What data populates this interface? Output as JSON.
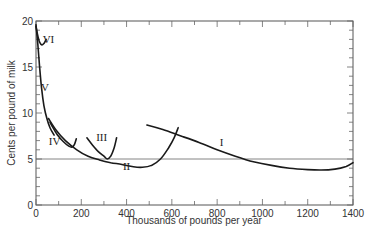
{
  "chart_data": {
    "type": "line",
    "title": "",
    "xlabel": "Thousands of pounds per year",
    "ylabel": "Cents per pound of milk",
    "xlim": [
      0,
      1400
    ],
    "ylim": [
      0,
      20
    ],
    "x_ticks": [
      0,
      200,
      400,
      600,
      800,
      1000,
      1200,
      1400
    ],
    "x_tick_labels": [
      "0",
      "200",
      "400",
      "600",
      "800",
      "1000",
      "1200",
      "1400"
    ],
    "x_minor_step": 100,
    "y_ticks": [
      0,
      5,
      10,
      15,
      20
    ],
    "y_tick_labels": [
      "0",
      "5",
      "10",
      "15",
      "20"
    ],
    "y_minor_step": 1,
    "grid": false,
    "reference_line": {
      "y": 5,
      "label": ""
    },
    "series": [
      {
        "name": "VI",
        "label_pos": [
          55,
          17.6
        ],
        "points": [
          [
            0,
            19.4
          ],
          [
            8,
            18.4
          ],
          [
            16,
            17.7
          ],
          [
            26,
            17.4
          ],
          [
            36,
            17.6
          ],
          [
            45,
            18.0
          ]
        ]
      },
      {
        "name": "V",
        "label_pos": [
          40,
          12.4
        ],
        "points": [
          [
            0,
            19.6
          ],
          [
            8,
            17.5
          ],
          [
            16,
            15.0
          ],
          [
            25,
            12.6
          ],
          [
            35,
            10.8
          ],
          [
            48,
            9.4
          ],
          [
            62,
            8.4
          ],
          [
            80,
            7.6
          ]
        ]
      },
      {
        "name": "IV",
        "label_pos": [
          82,
          6.5
        ],
        "points": [
          [
            62,
            9.0
          ],
          [
            75,
            8.4
          ],
          [
            95,
            7.6
          ],
          [
            120,
            6.9
          ],
          [
            145,
            6.4
          ],
          [
            160,
            6.3
          ],
          [
            170,
            6.6
          ],
          [
            178,
            7.2
          ]
        ]
      },
      {
        "name": "III",
        "label_pos": [
          290,
          7.0
        ],
        "points": [
          [
            225,
            7.3
          ],
          [
            250,
            6.5
          ],
          [
            275,
            5.8
          ],
          [
            300,
            5.3
          ],
          [
            315,
            5.0
          ],
          [
            330,
            5.3
          ],
          [
            345,
            6.2
          ],
          [
            356,
            7.3
          ]
        ]
      },
      {
        "name": "II",
        "label_pos": [
          400,
          3.8
        ],
        "points": [
          [
            55,
            9.4
          ],
          [
            90,
            8.1
          ],
          [
            130,
            7.0
          ],
          [
            180,
            6.0
          ],
          [
            230,
            5.3
          ],
          [
            280,
            4.9
          ],
          [
            330,
            4.6
          ],
          [
            380,
            4.4
          ],
          [
            430,
            4.15
          ],
          [
            470,
            4.1
          ],
          [
            510,
            4.3
          ],
          [
            550,
            5.0
          ],
          [
            585,
            6.2
          ],
          [
            610,
            7.3
          ],
          [
            628,
            8.4
          ]
        ]
      },
      {
        "name": "I",
        "label_pos": [
          820,
          6.4
        ],
        "points": [
          [
            490,
            8.7
          ],
          [
            560,
            8.2
          ],
          [
            640,
            7.5
          ],
          [
            720,
            6.8
          ],
          [
            800,
            6.0
          ],
          [
            880,
            5.3
          ],
          [
            960,
            4.7
          ],
          [
            1040,
            4.3
          ],
          [
            1120,
            4.0
          ],
          [
            1200,
            3.85
          ],
          [
            1260,
            3.8
          ],
          [
            1320,
            3.9
          ],
          [
            1370,
            4.2
          ],
          [
            1400,
            4.6
          ]
        ]
      }
    ]
  }
}
